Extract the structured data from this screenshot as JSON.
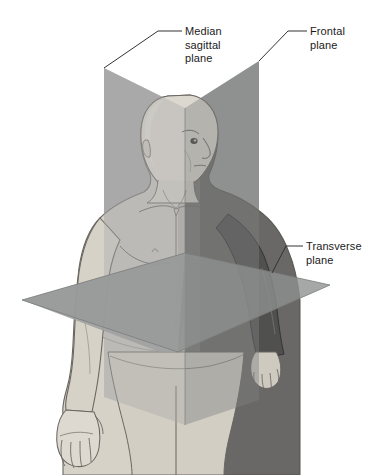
{
  "labels": [
    {
      "id": "median-sagittal",
      "text": "Median\nsagittal\nplane",
      "lines": [
        "Median",
        "sagittal",
        "plane"
      ],
      "anchor_x": 185,
      "anchor_y": 25,
      "leader_from_x": 178,
      "leader_from_y": 30,
      "leader_to_x": 104,
      "leader_to_y": 68
    },
    {
      "id": "frontal",
      "text": "Frontal\nplane",
      "lines": [
        "Frontal",
        "plane"
      ],
      "anchor_x": 310,
      "anchor_y": 25,
      "leader_from_x": 303,
      "leader_from_y": 30,
      "leader_to_x": 259,
      "leader_to_y": 61
    },
    {
      "id": "transverse",
      "text": "Transverse\nplane",
      "lines": [
        "Transverse",
        "plane"
      ],
      "anchor_x": 306,
      "anchor_y": 240,
      "leader_from_x": 299,
      "leader_from_y": 245,
      "leader_to_x": 272,
      "leader_to_y": 273
    }
  ],
  "planes": {
    "median_sagittal": {
      "name": "Median sagittal plane",
      "color": "#a9a9a9",
      "color_shadow": "#8f9191",
      "orientation": "vertical, divides body into left and right halves"
    },
    "frontal": {
      "name": "Frontal plane",
      "color": "#9c9e9e",
      "color_shadow": "#4b4b4b",
      "orientation": "vertical, divides body into anterior and posterior"
    },
    "transverse": {
      "name": "Transverse plane",
      "color": "#9a9a9a",
      "color_shadow": "#808080",
      "orientation": "horizontal, divides body into superior and inferior"
    }
  },
  "colors": {
    "background": "#ffffff",
    "text": "#1a1a1a",
    "leader_line": "#333333",
    "skin_light": "#d8d4cb",
    "skin_mid": "#c4bfb4",
    "skin_shadow": "#8d8a83",
    "outline": "#5e5b56"
  }
}
